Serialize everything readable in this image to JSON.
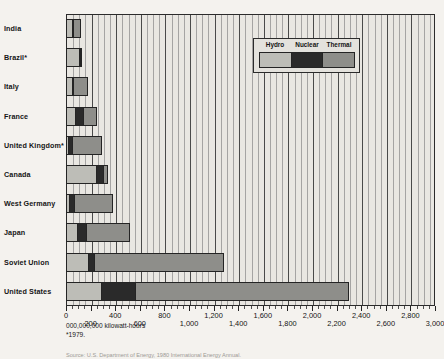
{
  "chart_data": {
    "type": "bar",
    "orientation": "horizontal",
    "stacked": true,
    "title": "",
    "xlabel": "000,000,000 kilowatt-hours",
    "ylabel": "",
    "xlim": [
      0,
      3000
    ],
    "xticks": [
      0,
      200,
      400,
      600,
      800,
      1000,
      1200,
      1400,
      1600,
      1800,
      2000,
      2200,
      2400,
      2600,
      2800,
      3000
    ],
    "xticklabels": [
      "0",
      "200",
      "400",
      "600",
      "800",
      "1,000",
      "1,200",
      "1,400",
      "1,600",
      "1,800",
      "2,000",
      "2,200",
      "2,400",
      "2,600",
      "2,800",
      "3,000"
    ],
    "minor_tick_step": 50,
    "grid": true,
    "grid_axis": "x",
    "legend_position": "top-right",
    "categories": [
      "India",
      "Brazil*",
      "Italy",
      "France",
      "United Kingdom*",
      "Canada",
      "West Germany",
      "Japan",
      "Soviet Union",
      "United States"
    ],
    "series": [
      {
        "name": "Hydro",
        "color": "#bdbdb7",
        "values": [
          45,
          115,
          45,
          70,
          10,
          245,
          20,
          85,
          170,
          280
        ]
      },
      {
        "name": "Nuclear",
        "color": "#2a2a2a",
        "values": [
          3,
          2,
          2,
          65,
          35,
          60,
          40,
          75,
          55,
          280
        ]
      },
      {
        "name": "Thermal",
        "color": "#8e8e8a",
        "values": [
          75,
          10,
          130,
          120,
          245,
          35,
          325,
          360,
          1060,
          1740
        ]
      }
    ],
    "annotations": [
      "000,000,000 kilowatt-hours",
      "*1979."
    ],
    "source": "Source: U.S. Department of Energy, 1980 International Energy Annual."
  },
  "legend": {
    "items": [
      {
        "label": "Hydro"
      },
      {
        "label": "Nuclear"
      },
      {
        "label": "Thermal"
      }
    ]
  }
}
